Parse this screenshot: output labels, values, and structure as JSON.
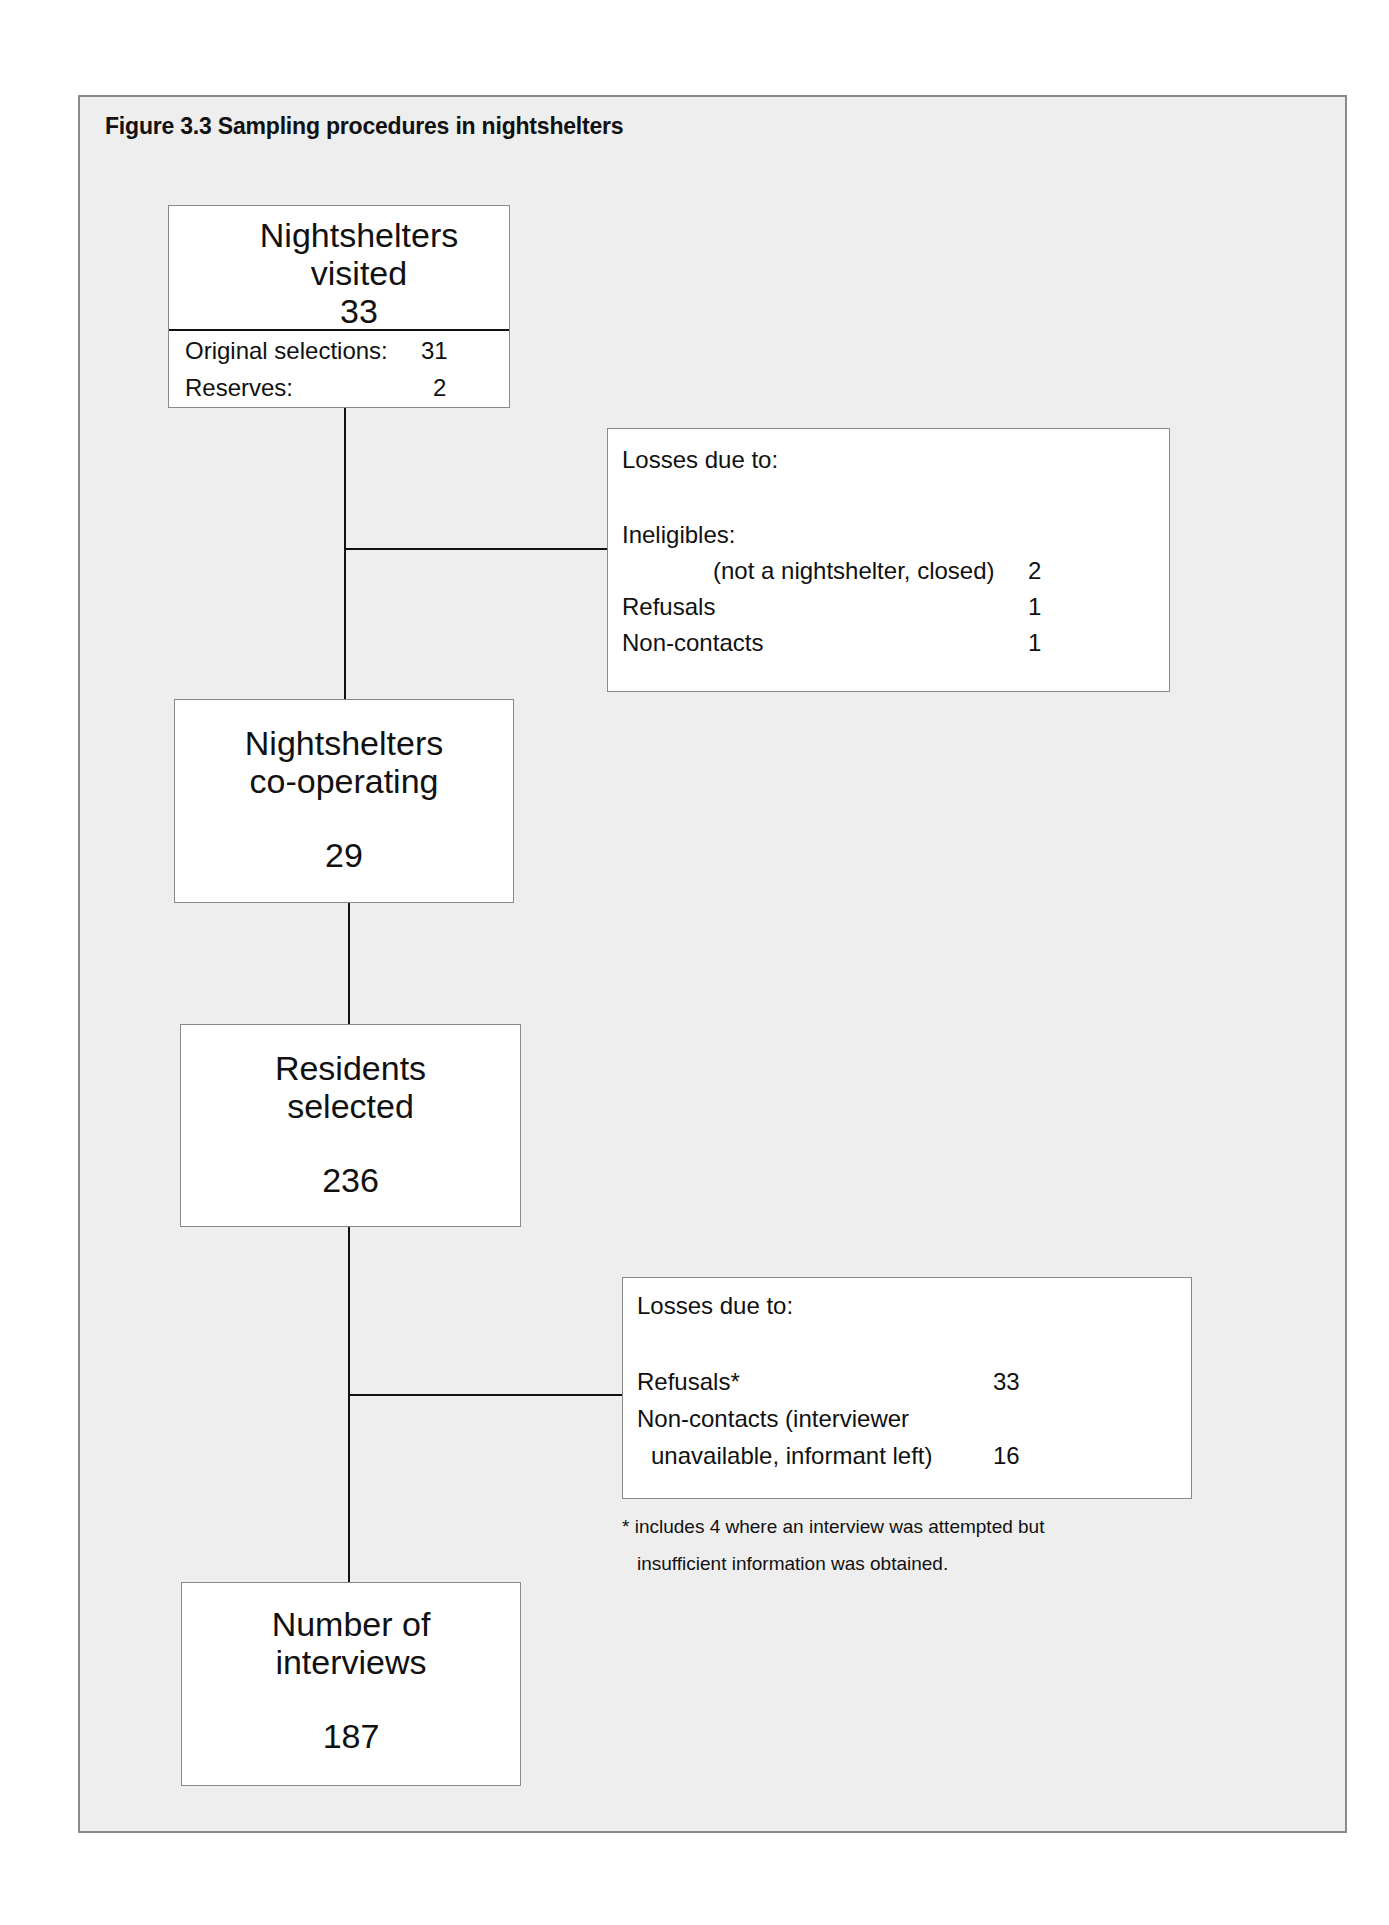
{
  "figure": {
    "title": "Figure 3.3  Sampling procedures in nightshelters"
  },
  "nodes": {
    "visited": {
      "line1": "Nightshelters",
      "line2": "visited",
      "value": "33",
      "details": [
        {
          "label": "Original selections:",
          "value": "31"
        },
        {
          "label": "Reserves:",
          "value": "2"
        }
      ]
    },
    "cooperating": {
      "line1": "Nightshelters",
      "line2": "co-operating",
      "value": "29"
    },
    "residents": {
      "line1": "Residents",
      "line2": "selected",
      "value": "236"
    },
    "interviews": {
      "line1": "Number of",
      "line2": "interviews",
      "value": "187"
    }
  },
  "losses1": {
    "heading": "Losses due to:",
    "items": [
      {
        "label": "Ineligibles:",
        "value": ""
      },
      {
        "label": "(not a nightshelter, closed)",
        "value": "2"
      },
      {
        "label": "Refusals",
        "value": "1"
      },
      {
        "label": "Non-contacts",
        "value": "1"
      }
    ]
  },
  "losses2": {
    "heading": "Losses due to:",
    "items": [
      {
        "label": "Refusals*",
        "value": "33"
      },
      {
        "label": "Non-contacts (interviewer",
        "value": ""
      },
      {
        "label": "unavailable, informant left)",
        "value": "16"
      }
    ],
    "footnote_line1": "* includes 4 where an interview was attempted but",
    "footnote_line2": "insufficient information was obtained."
  },
  "colors": {
    "background": "#eeeeee",
    "box": "#ffffff",
    "border": "#8a8a8a",
    "connector": "#111111"
  }
}
